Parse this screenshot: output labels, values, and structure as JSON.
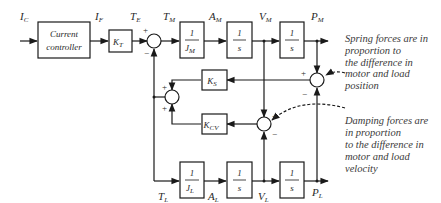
{
  "signals": {
    "ic": {
      "main": "I",
      "sub": "C"
    },
    "if": {
      "main": "I",
      "sub": "F"
    },
    "te": {
      "main": "T",
      "sub": "E"
    },
    "tm": {
      "main": "T",
      "sub": "M"
    },
    "am": {
      "main": "A",
      "sub": "M"
    },
    "vm": {
      "main": "V",
      "sub": "M"
    },
    "pm": {
      "main": "P",
      "sub": "M"
    },
    "tl": {
      "main": "T",
      "sub": "L"
    },
    "al": {
      "main": "A",
      "sub": "L"
    },
    "vl": {
      "main": "V",
      "sub": "L"
    },
    "pl": {
      "main": "P",
      "sub": "L"
    }
  },
  "blocks": {
    "controller": {
      "line1": "Current",
      "line2": "controller"
    },
    "kt": {
      "main": "K",
      "sub": "T"
    },
    "jm": {
      "num": "1",
      "den_main": "J",
      "den_sub": "M"
    },
    "int_am": {
      "num": "1",
      "den": "s"
    },
    "int_vm": {
      "num": "1",
      "den": "s"
    },
    "ks": {
      "main": "K",
      "sub": "S"
    },
    "kcv": {
      "main": "K",
      "sub": "CV"
    },
    "jl": {
      "num": "1",
      "den_main": "J",
      "den_sub": "L"
    },
    "int_al": {
      "num": "1",
      "den": "s"
    },
    "int_vl": {
      "num": "1",
      "den": "s"
    }
  },
  "signs": {
    "plus": "+",
    "minus": "−"
  },
  "annotations": {
    "spring": [
      "Spring forces are in",
      "proportion to",
      "the difference in",
      "motor and load",
      "position"
    ],
    "damping": [
      "Damping forces are",
      "in proportion",
      "to the difference in",
      "motor and load",
      "velocity"
    ]
  }
}
